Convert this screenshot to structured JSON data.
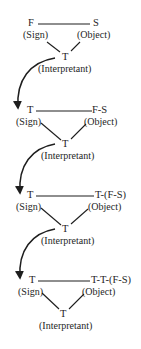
{
  "diagram": {
    "type": "semiotic-triads-chain",
    "colors": {
      "ink": "#1e1e1e",
      "background": "#ffffff"
    },
    "triads": [
      {
        "sign": "F",
        "sign_role": "(Sign)",
        "object": "S",
        "object_role": "(Object)",
        "interpretant": "T",
        "interpretant_role": "(Interpretant)"
      },
      {
        "sign": "T",
        "sign_role": "(Sign)",
        "object": "F-S",
        "object_role": "(Object)",
        "interpretant": "T",
        "interpretant_role": "(Interpretant)"
      },
      {
        "sign": "T",
        "sign_role": "(Sign)",
        "object": "T-(F-S)",
        "object_role": "(Object)",
        "interpretant": "T",
        "interpretant_role": "(Interpretant)"
      },
      {
        "sign": "T",
        "sign_role": "(Sign)",
        "object": "T-T-(F-S)",
        "object_role": "(Object)",
        "interpretant": "T",
        "interpretant_role": "(Interpretant)"
      }
    ],
    "arrows": [
      {
        "from": "triads.0.interpretant",
        "to": "triads.1.sign"
      },
      {
        "from": "triads.1.interpretant",
        "to": "triads.2.sign"
      },
      {
        "from": "triads.2.interpretant",
        "to": "triads.3.sign"
      }
    ]
  }
}
